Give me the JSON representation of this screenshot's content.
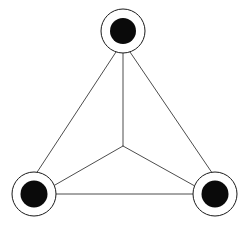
{
  "canvas": {
    "width": 247,
    "height": 235,
    "background_color": "#ffffff",
    "title": "Triangular node network diagram"
  },
  "style": {
    "edge_color": "#4d4d4d",
    "edge_width": 1,
    "spoke_color": "#4d4d4d",
    "spoke_width": 1,
    "node_fill_color": "#0a0a0a",
    "node_ring_color": "#1a1a1a",
    "node_ring_width": 1,
    "node_ring_fill": "#ffffff"
  },
  "nodes": [
    {
      "id": "node-top",
      "label": "top",
      "cx": 123,
      "cy": 31,
      "ring_radius": 22,
      "disk_radius": 13
    },
    {
      "id": "node-bottom-left",
      "label": "bottom-left",
      "cx": 34,
      "cy": 194,
      "ring_radius": 22,
      "disk_radius": 13.5
    },
    {
      "id": "node-bottom-right",
      "label": "bottom-right",
      "cx": 215,
      "cy": 194,
      "ring_radius": 22,
      "disk_radius": 13.5
    }
  ],
  "hub": {
    "id": "hub-center",
    "label": "center junction",
    "cx": 123,
    "cy": 146
  },
  "edges": [
    {
      "id": "edge-top-left",
      "from": "node-top",
      "to": "node-bottom-left",
      "x1": 116,
      "y1": 52,
      "x2": 28,
      "y2": 186
    },
    {
      "id": "edge-top-right",
      "from": "node-top",
      "to": "node-bottom-right",
      "x1": 130,
      "y1": 52,
      "x2": 221,
      "y2": 186
    },
    {
      "id": "edge-left-right",
      "from": "node-bottom-left",
      "to": "node-bottom-right",
      "x1": 34,
      "y1": 194,
      "x2": 215,
      "y2": 194
    }
  ],
  "spokes": [
    {
      "id": "spoke-hub-top",
      "from": "hub-center",
      "to": "node-top",
      "x1": 123,
      "y1": 146,
      "x2": 123,
      "y2": 50
    },
    {
      "id": "spoke-hub-bottom-left",
      "from": "hub-center",
      "to": "node-bottom-left",
      "x1": 123,
      "y1": 146,
      "x2": 48,
      "y2": 189
    },
    {
      "id": "spoke-hub-bottom-right",
      "from": "hub-center",
      "to": "node-bottom-right",
      "x1": 123,
      "y1": 146,
      "x2": 202,
      "y2": 190
    }
  ]
}
